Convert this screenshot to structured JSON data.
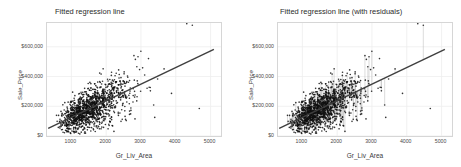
{
  "figure": {
    "background": "#ffffff",
    "point_color": "#111111",
    "line_color": "#3f3f3f",
    "residual_color": "#9a9a9a",
    "grid_color": "#ededed",
    "panel_border": "#d6d6d6"
  },
  "panels": [
    {
      "id": "left",
      "title": "Fitted regression line",
      "xlabel": "Gr_Liv_Area",
      "ylabel": "Sale_Price",
      "show_residuals": false
    },
    {
      "id": "right",
      "title": "Fitted regression line (with residuals)",
      "xlabel": "Gr_Liv_Area",
      "ylabel": "Sale_Price",
      "show_residuals": true
    }
  ],
  "chart_data": {
    "type": "scatter",
    "title": "Fitted regression line",
    "xlabel": "Gr_Liv_Area",
    "ylabel": "Sale_Price",
    "xlim": [
      300,
      5300
    ],
    "ylim": [
      0,
      760000
    ],
    "xticks": [
      1000,
      2000,
      3000,
      4000,
      5000
    ],
    "xtick_labels": [
      "1000",
      "2000",
      "3000",
      "4000",
      "5000"
    ],
    "yticks": [
      0,
      200000,
      400000,
      600000
    ],
    "ytick_labels": [
      "$0",
      "$200,000",
      "$400,000",
      "$600,000"
    ],
    "grid": true,
    "legend": null,
    "series": [
      {
        "name": "Observations",
        "type": "scatter",
        "marker": "point",
        "color": "#111111",
        "n_points": 2930
      },
      {
        "name": "Fitted regression line",
        "type": "line",
        "color": "#3f3f3f",
        "intercept": 13290,
        "slope": 111.7,
        "x_start": 334,
        "x_end": 5095,
        "y_start": 50600,
        "y_end": 582400
      },
      {
        "name": "Residual segments",
        "type": "vertical-segments",
        "color": "#9a9a9a",
        "panel": "right"
      }
    ],
    "notable_points": [
      {
        "x": 4316,
        "y": 755000,
        "note": "high outlier"
      },
      {
        "x": 4476,
        "y": 745000,
        "note": "high outlier"
      },
      {
        "x": 4676,
        "y": 184750,
        "note": "low outlier partial sale"
      },
      {
        "x": 5642,
        "y": 160000,
        "note": "low outlier partial sale"
      }
    ]
  }
}
